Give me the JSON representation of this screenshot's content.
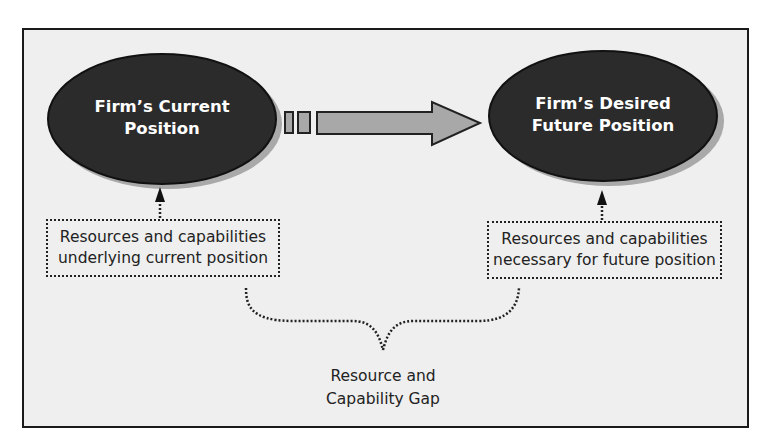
{
  "diagram": {
    "nodes": {
      "current_position": {
        "label": "Firm’s Current\nPosition"
      },
      "future_position": {
        "label": "Firm’s Desired\nFuture Position"
      }
    },
    "boxes": {
      "current_resources": {
        "label": "Resources and capabilities\nunderlying current position"
      },
      "future_resources": {
        "label": "Resources and capabilities\nnecessary for future position"
      }
    },
    "gap": {
      "label": "Resource and\nCapability Gap"
    },
    "edges": [
      {
        "from": "current_position",
        "to": "future_position",
        "style": "block-arrow"
      },
      {
        "from": "current_resources",
        "to": "current_position",
        "style": "dotted-arrow"
      },
      {
        "from": "future_resources",
        "to": "future_position",
        "style": "dotted-arrow"
      },
      {
        "from": [
          "current_resources",
          "future_resources"
        ],
        "to": "gap",
        "style": "dotted-brace"
      }
    ],
    "colors": {
      "ellipse_fill": "#2b2b2b",
      "ellipse_shadow": "#a9a9a9",
      "arrow_fill": "#a8a8a8",
      "background": "#efefef",
      "border": "#1a1a1a"
    }
  }
}
